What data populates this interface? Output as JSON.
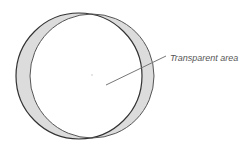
{
  "diagram": {
    "annotation": "Transparent area",
    "colors": {
      "background": "#ffffff",
      "crescent_fill": "#dcdcdc",
      "outline": "#333333",
      "leader_line": "#777777",
      "label": "#555555"
    }
  }
}
